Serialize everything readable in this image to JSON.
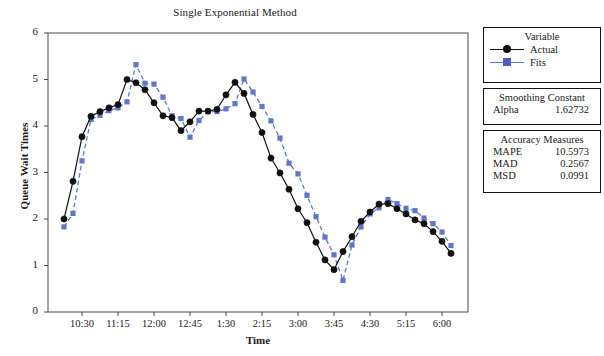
{
  "chart_data": {
    "type": "line",
    "title": "Single Exponential Method",
    "xlabel": "Time",
    "ylabel": "Queue Wait Times",
    "ylim": [
      0,
      6
    ],
    "yticks": [
      "0",
      "1",
      "2",
      "3",
      "4",
      "5",
      "6"
    ],
    "xticks": [
      "10:30",
      "11:15",
      "12:00",
      "12:45",
      "1:30",
      "2:15",
      "3:00",
      "3:45",
      "4:30",
      "5:15",
      "6:00"
    ],
    "grid": false,
    "legend_position": "right",
    "x": [
      1,
      2,
      3,
      4,
      5,
      6,
      7,
      8,
      9,
      10,
      11,
      12,
      13,
      14,
      15,
      16,
      17,
      18,
      19,
      20,
      21,
      22,
      23,
      24,
      25,
      26,
      27,
      28,
      29,
      30,
      31,
      32,
      33,
      34,
      35,
      36,
      37,
      38,
      39,
      40,
      41,
      42,
      43,
      44
    ],
    "series": [
      {
        "name": "Actual",
        "color": "#111111",
        "marker": "circle",
        "linestyle": "solid",
        "values": [
          2.0,
          2.81,
          3.77,
          4.21,
          4.31,
          4.39,
          4.46,
          5.0,
          4.93,
          4.78,
          4.5,
          4.22,
          4.18,
          3.9,
          4.09,
          4.32,
          4.32,
          4.36,
          4.67,
          4.94,
          4.7,
          4.25,
          3.86,
          3.31,
          2.99,
          2.64,
          2.22,
          1.92,
          1.5,
          1.12,
          0.91,
          1.3,
          1.62,
          1.95,
          2.15,
          2.32,
          2.33,
          2.22,
          2.11,
          1.98,
          1.9,
          1.73,
          1.52,
          1.26
        ]
      },
      {
        "name": "Fits",
        "color": "#6077c9",
        "marker": "square",
        "linestyle": "dashed",
        "values": [
          1.83,
          2.12,
          3.25,
          4.14,
          4.23,
          4.33,
          4.39,
          4.52,
          5.32,
          4.92,
          4.9,
          4.62,
          4.22,
          4.16,
          3.76,
          4.12,
          4.31,
          4.31,
          4.37,
          4.48,
          5.01,
          4.73,
          4.42,
          4.11,
          3.74,
          3.2,
          2.97,
          2.51,
          2.05,
          1.61,
          1.23,
          0.68,
          1.44,
          1.83,
          2.11,
          2.24,
          2.42,
          2.33,
          2.23,
          2.18,
          2.02,
          1.9,
          1.72,
          1.43
        ]
      }
    ]
  },
  "legend": {
    "heading": "Variable",
    "entries": [
      {
        "label": "Actual",
        "marker": "circle-marker",
        "color": "#111111"
      },
      {
        "label": "Fits",
        "marker": "square-marker",
        "color": "#6077c9"
      }
    ]
  },
  "smoothing": {
    "heading": "Smoothing Constant",
    "rows": [
      {
        "key": "Alpha",
        "value": "1.62732"
      }
    ]
  },
  "accuracy": {
    "heading": "Accuracy Measures",
    "rows": [
      {
        "key": "MAPE",
        "value": "10.5973"
      },
      {
        "key": "MAD",
        "value": "0.2567"
      },
      {
        "key": "MSD",
        "value": "0.0991"
      }
    ]
  }
}
